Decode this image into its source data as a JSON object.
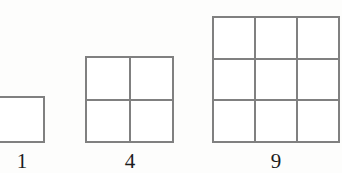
{
  "figure": {
    "background_color": "#fdfdfc",
    "line_color": "#808080",
    "label_color": "#1c1c1c"
  },
  "chart_data": {
    "type": "diagram",
    "categories": [
      "1",
      "4",
      "9"
    ],
    "values": [
      1,
      4,
      9
    ],
    "series": [
      {
        "name": "grid side length",
        "values": [
          1,
          2,
          3
        ]
      },
      {
        "name": "total unit squares",
        "values": [
          1,
          4,
          9
        ]
      }
    ],
    "annotations": [
      "1",
      "4",
      "9"
    ],
    "xlabel": "",
    "ylabel": "",
    "legend": "none",
    "grid": true
  },
  "figures": [
    {
      "id": "fig-1",
      "label": "1",
      "rows": 1,
      "cols": 2,
      "cell_count": 1,
      "clipped": "left"
    },
    {
      "id": "fig-4",
      "label": "4",
      "rows": 2,
      "cols": 2,
      "cell_count": 4,
      "clipped": "none"
    },
    {
      "id": "fig-9",
      "label": "9",
      "rows": 3,
      "cols": 3,
      "cell_count": 9,
      "clipped": "right"
    }
  ],
  "labels": {
    "one": "1",
    "four": "4",
    "nine": "9"
  }
}
